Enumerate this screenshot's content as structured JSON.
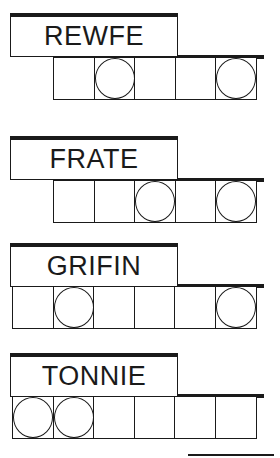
{
  "puzzles": [
    {
      "scrambled": "REWFE",
      "letters": 5,
      "circled": [
        1,
        4
      ]
    },
    {
      "scrambled": "FRATE",
      "letters": 5,
      "circled": [
        2,
        4
      ]
    },
    {
      "scrambled": "GRIFIN",
      "letters": 6,
      "circled": [
        1,
        5
      ]
    },
    {
      "scrambled": "TONNIE",
      "letters": 6,
      "circled": [
        0,
        1
      ]
    }
  ],
  "colors": {
    "ink": "#1a1a1a",
    "background": "#ffffff"
  }
}
